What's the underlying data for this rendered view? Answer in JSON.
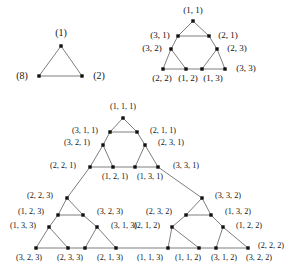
{
  "figure": {
    "background_color": "#ffffff",
    "edge_color": "#6f6f6f",
    "node_color": "#111111",
    "label_color": "#151515",
    "caption": ""
  },
  "panels": [
    {
      "id": "panel-level-1",
      "name": "level-1-triangle",
      "label_size_class": "s1",
      "origin": {
        "x": 15,
        "y": 18
      },
      "scale": 1,
      "nodes": [
        {
          "id": "n1",
          "label": "(1)",
          "x": 61,
          "y": 46,
          "label_x": 61,
          "label_y": 33,
          "anchor": "center"
        },
        {
          "id": "n8",
          "label": "(8)",
          "x": 39,
          "y": 76,
          "label_x": 22,
          "label_y": 76,
          "anchor": "right"
        },
        {
          "id": "n2",
          "label": "(2)",
          "x": 82,
          "y": 76,
          "label_x": 99,
          "label_y": 76,
          "anchor": "left"
        }
      ],
      "edges": [
        [
          "n1",
          "n8"
        ],
        [
          "n1",
          "n2"
        ],
        [
          "n8",
          "n2"
        ]
      ]
    },
    {
      "id": "panel-level-2",
      "name": "level-2-triangle",
      "label_size_class": "s2",
      "nodes": [
        {
          "id": "a11",
          "label": "(1, 1)",
          "x": 193,
          "y": 21,
          "label_x": 193,
          "label_y": 10
        },
        {
          "id": "a31",
          "label": "(3, 1)",
          "x": 178,
          "y": 36,
          "label_x": 160,
          "label_y": 35
        },
        {
          "id": "a21",
          "label": "(2, 1)",
          "x": 209,
          "y": 36,
          "label_x": 228,
          "label_y": 35
        },
        {
          "id": "a32",
          "label": "(3, 2)",
          "x": 171,
          "y": 49,
          "label_x": 152,
          "label_y": 48
        },
        {
          "id": "a23",
          "label": "(2, 3)",
          "x": 217,
          "y": 49,
          "label_x": 237,
          "label_y": 48
        },
        {
          "id": "a22",
          "label": "(2, 2)",
          "x": 163,
          "y": 69,
          "label_x": 162,
          "label_y": 78
        },
        {
          "id": "a12",
          "label": "(1, 2)",
          "x": 186,
          "y": 69,
          "label_x": 188,
          "label_y": 78
        },
        {
          "id": "a13",
          "label": "(1, 3)",
          "x": 202,
          "y": 69,
          "label_x": 213,
          "label_y": 78
        },
        {
          "id": "a33",
          "label": "(3, 3)",
          "x": 225,
          "y": 69,
          "label_x": 246,
          "label_y": 68
        }
      ],
      "edges": [
        [
          "a11",
          "a31"
        ],
        [
          "a11",
          "a21"
        ],
        [
          "a31",
          "a21"
        ],
        [
          "a31",
          "a32"
        ],
        [
          "a21",
          "a23"
        ],
        [
          "a32",
          "a22"
        ],
        [
          "a32",
          "a12"
        ],
        [
          "a22",
          "a12"
        ],
        [
          "a23",
          "a13"
        ],
        [
          "a23",
          "a33"
        ],
        [
          "a13",
          "a33"
        ],
        [
          "a12",
          "a13"
        ]
      ]
    },
    {
      "id": "panel-level-3",
      "name": "level-3-triangle",
      "label_size_class": "s3",
      "nodes": [
        {
          "id": "b111",
          "label": "(1, 1, 1)",
          "x": 123,
          "y": 118,
          "label_x": 123,
          "label_y": 107
        },
        {
          "id": "b311",
          "label": "(3, 1, 1)",
          "x": 110,
          "y": 132,
          "label_x": 85,
          "label_y": 131
        },
        {
          "id": "b211",
          "label": "(2, 1, 1)",
          "x": 137,
          "y": 132,
          "label_x": 163,
          "label_y": 131
        },
        {
          "id": "b321",
          "label": "(3, 2, 1)",
          "x": 103,
          "y": 145,
          "label_x": 77,
          "label_y": 143
        },
        {
          "id": "b231",
          "label": "(2, 3, 1)",
          "x": 145,
          "y": 145,
          "label_x": 171,
          "label_y": 143
        },
        {
          "id": "b221",
          "label": "(2, 2, 1)",
          "x": 90,
          "y": 167,
          "label_x": 63,
          "label_y": 166
        },
        {
          "id": "b121",
          "label": "(1, 2, 1)",
          "x": 113,
          "y": 167,
          "label_x": 115,
          "label_y": 177
        },
        {
          "id": "b131",
          "label": "(1, 3, 1)",
          "x": 135,
          "y": 167,
          "label_x": 150,
          "label_y": 177
        },
        {
          "id": "b331",
          "label": "(3, 3, 1)",
          "x": 158,
          "y": 167,
          "label_x": 186,
          "label_y": 166
        },
        {
          "id": "b223",
          "label": "(2, 2, 3)",
          "x": 67,
          "y": 198,
          "label_x": 40,
          "label_y": 196
        },
        {
          "id": "b123",
          "label": "(1, 2, 3)",
          "x": 58,
          "y": 215,
          "label_x": 31,
          "label_y": 212
        },
        {
          "id": "b323",
          "label": "(3, 2, 3)",
          "x": 83,
          "y": 215,
          "label_x": 110,
          "label_y": 212
        },
        {
          "id": "b133",
          "label": "(1, 3, 3)",
          "x": 49,
          "y": 227,
          "label_x": 23,
          "label_y": 226
        },
        {
          "id": "b313",
          "label": "(3, 1, 3)",
          "x": 97,
          "y": 227,
          "label_x": 124,
          "label_y": 226
        },
        {
          "id": "b323b",
          "label": "(3, 2, 3)",
          "x": 36,
          "y": 248,
          "label_x": 29,
          "label_y": 258
        },
        {
          "id": "b233",
          "label": "(2, 3, 3)",
          "x": 68,
          "y": 248,
          "label_x": 70,
          "label_y": 258
        },
        {
          "id": "b213",
          "label": "(2, 1, 3)",
          "x": 85,
          "y": 248,
          "label_x": 110,
          "label_y": 258
        },
        {
          "id": "b113",
          "label": "(1, 1, 3)",
          "x": 116,
          "y": 248,
          "label_x": 150,
          "label_y": 258
        },
        {
          "id": "b332",
          "label": "(3, 3, 2)",
          "x": 202,
          "y": 198,
          "label_x": 228,
          "label_y": 196
        },
        {
          "id": "b232",
          "label": "(2, 3, 2)",
          "x": 186,
          "y": 215,
          "label_x": 159,
          "label_y": 212
        },
        {
          "id": "b132",
          "label": "(1, 3, 2)",
          "x": 211,
          "y": 215,
          "label_x": 238,
          "label_y": 212
        },
        {
          "id": "b212",
          "label": "(2, 1, 2)",
          "x": 172,
          "y": 227,
          "label_x": 147,
          "label_y": 226
        },
        {
          "id": "b122",
          "label": "(1, 2, 2)",
          "x": 223,
          "y": 227,
          "label_x": 249,
          "label_y": 226
        },
        {
          "id": "b112",
          "label": "(1, 1, 2)",
          "x": 168,
          "y": 248,
          "label_x": 188,
          "label_y": 258
        },
        {
          "id": "b312",
          "label": "(3, 1, 2)",
          "x": 199,
          "y": 248,
          "label_x": 224,
          "label_y": 258
        },
        {
          "id": "b322",
          "label": "(3, 2, 2)",
          "x": 216,
          "y": 248,
          "label_x": 259,
          "label_y": 258
        },
        {
          "id": "b222",
          "label": "(2, 2, 2)",
          "x": 248,
          "y": 248,
          "label_x": 271,
          "label_y": 246
        }
      ],
      "edges": [
        [
          "b111",
          "b311"
        ],
        [
          "b111",
          "b211"
        ],
        [
          "b311",
          "b211"
        ],
        [
          "b311",
          "b321"
        ],
        [
          "b211",
          "b231"
        ],
        [
          "b321",
          "b221"
        ],
        [
          "b321",
          "b121"
        ],
        [
          "b221",
          "b121"
        ],
        [
          "b231",
          "b131"
        ],
        [
          "b231",
          "b331"
        ],
        [
          "b131",
          "b331"
        ],
        [
          "b121",
          "b131"
        ],
        [
          "b221",
          "b223"
        ],
        [
          "b223",
          "b123"
        ],
        [
          "b223",
          "b323"
        ],
        [
          "b123",
          "b323"
        ],
        [
          "b123",
          "b133"
        ],
        [
          "b323",
          "b313"
        ],
        [
          "b133",
          "b323b"
        ],
        [
          "b133",
          "b233"
        ],
        [
          "b323b",
          "b233"
        ],
        [
          "b313",
          "b213"
        ],
        [
          "b313",
          "b113"
        ],
        [
          "b213",
          "b113"
        ],
        [
          "b233",
          "b213"
        ],
        [
          "b331",
          "b332"
        ],
        [
          "b332",
          "b232"
        ],
        [
          "b332",
          "b132"
        ],
        [
          "b232",
          "b132"
        ],
        [
          "b232",
          "b212"
        ],
        [
          "b132",
          "b122"
        ],
        [
          "b212",
          "b112"
        ],
        [
          "b212",
          "b312"
        ],
        [
          "b112",
          "b312"
        ],
        [
          "b122",
          "b322"
        ],
        [
          "b122",
          "b222"
        ],
        [
          "b322",
          "b222"
        ],
        [
          "b312",
          "b322"
        ],
        [
          "b113",
          "b112"
        ]
      ]
    }
  ],
  "chart_data": {
    "type": "diagram",
    "panel_labels": {
      "level_1": [
        "(1)",
        "(8)",
        "(2)"
      ],
      "level_2": [
        "(1, 1)",
        "(3, 1)",
        "(2, 1)",
        "(3, 2)",
        "(2, 3)",
        "(2, 2)",
        "(1, 2)",
        "(1, 3)",
        "(3, 3)"
      ],
      "level_3": [
        "(1, 1, 1)",
        "(3, 1, 1)",
        "(2, 1, 1)",
        "(3, 2, 1)",
        "(2, 3, 1)",
        "(2, 2, 1)",
        "(1, 2, 1)",
        "(1, 3, 1)",
        "(3, 3, 1)",
        "(2, 2, 3)",
        "(1, 2, 3)",
        "(3, 2, 3)",
        "(1, 3, 3)",
        "(3, 1, 3)",
        "(3, 2, 3)",
        "(2, 3, 3)",
        "(2, 1, 3)",
        "(1, 1, 3)",
        "(3, 3, 2)",
        "(2, 3, 2)",
        "(1, 3, 2)",
        "(2, 1, 2)",
        "(1, 2, 2)",
        "(1, 1, 2)",
        "(3, 1, 2)",
        "(3, 2, 2)",
        "(2, 2, 2)"
      ]
    }
  }
}
